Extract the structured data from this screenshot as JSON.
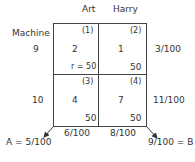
{
  "diagram": {
    "columns": [
      "Art",
      "Harry"
    ],
    "row_header": "Machine",
    "rows": [
      {
        "label": "9",
        "row_prob": "3/100"
      },
      {
        "label": "10",
        "row_prob": "11/100"
      }
    ],
    "cells": [
      {
        "index": "(1)",
        "value": "2",
        "corner": "r = 50"
      },
      {
        "index": "(2)",
        "value": "1",
        "corner": "50"
      },
      {
        "index": "(3)",
        "value": "4",
        "corner": "50"
      },
      {
        "index": "(4)",
        "value": "7",
        "corner": "50"
      }
    ],
    "col_probs": [
      "6/100",
      "8/100"
    ],
    "left_arrow_label": "A = 5/100",
    "right_arrow_label": "9/100 = B"
  }
}
